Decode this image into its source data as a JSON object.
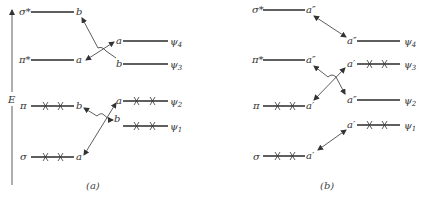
{
  "figure": {
    "axis_label": "E",
    "panel_a": {
      "caption": "(a)",
      "left_levels": [
        {
          "name": "σ*",
          "symmetry": "b",
          "electrons": 0
        },
        {
          "name": "π*",
          "symmetry": "a",
          "electrons": 0
        },
        {
          "name": "π",
          "symmetry": "b",
          "electrons": 2
        },
        {
          "name": "σ",
          "symmetry": "a",
          "electrons": 2
        }
      ],
      "right_levels": [
        {
          "name": "ψ4",
          "symmetry": "a",
          "electrons": 0
        },
        {
          "name": "ψ3",
          "symmetry": "b",
          "electrons": 0
        },
        {
          "name": "ψ2",
          "symmetry": "a",
          "electrons": 2
        },
        {
          "name": "ψ1",
          "symmetry": "b",
          "electrons": 2
        }
      ]
    },
    "panel_b": {
      "caption": "(b)",
      "left_levels": [
        {
          "name": "σ*",
          "symmetry": "a″",
          "electrons": 0
        },
        {
          "name": "π*",
          "symmetry": "a″",
          "electrons": 0
        },
        {
          "name": "π",
          "symmetry": "a′",
          "electrons": 2
        },
        {
          "name": "σ",
          "symmetry": "a′",
          "electrons": 2
        }
      ],
      "right_levels": [
        {
          "name": "ψ4",
          "symmetry": "a″",
          "electrons": 0
        },
        {
          "name": "ψ3",
          "symmetry": "a′",
          "electrons": 2
        },
        {
          "name": "ψ2",
          "symmetry": "a″",
          "electrons": 0
        },
        {
          "name": "ψ1",
          "symmetry": "a′",
          "electrons": 2
        }
      ]
    }
  },
  "labels": {
    "E": "E",
    "a_sigma_star": "σ*",
    "a_pi_star": "π*",
    "a_pi": "π",
    "a_sigma": "σ",
    "a_l1": "b",
    "a_l2": "a",
    "a_l3": "b",
    "a_l4": "a",
    "a_r4": "a",
    "a_r3": "b",
    "a_r2": "a",
    "a_r1": "b",
    "a_psi4": "ψ",
    "a_psi4_sub": "4",
    "a_psi3": "ψ",
    "a_psi3_sub": "3",
    "a_psi2": "ψ",
    "a_psi2_sub": "2",
    "a_psi1": "ψ",
    "a_psi1_sub": "1",
    "a_caption": "(a)",
    "b_sigma_star": "σ*",
    "b_pi_star": "π*",
    "b_pi": "π",
    "b_sigma": "σ",
    "b_l1": "a″",
    "b_l2": "a″",
    "b_l3": "a′",
    "b_l4": "a′",
    "b_r4": "a″",
    "b_r3": "a′",
    "b_r2": "a″",
    "b_r1": "a′",
    "b_psi4": "ψ",
    "b_psi4_sub": "4",
    "b_psi3": "ψ",
    "b_psi3_sub": "3",
    "b_psi2": "ψ",
    "b_psi2_sub": "2",
    "b_psi1": "ψ",
    "b_psi1_sub": "1",
    "b_caption": "(b)"
  }
}
